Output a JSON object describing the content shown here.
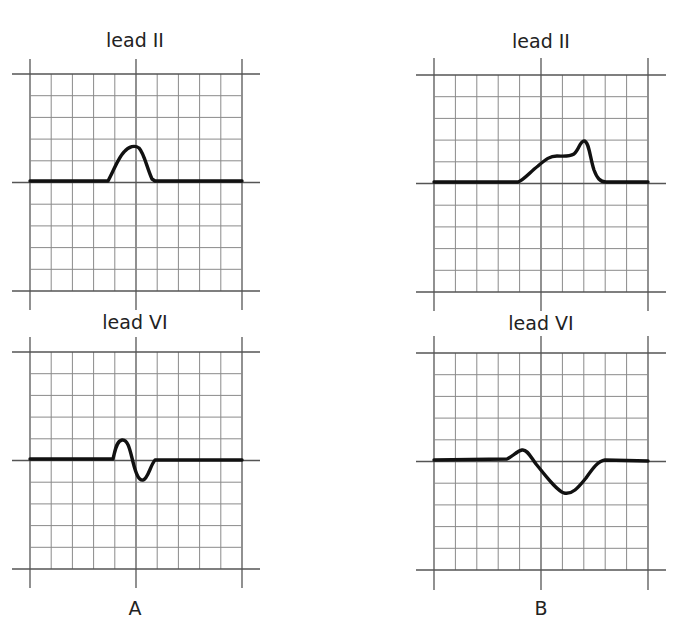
{
  "figure": {
    "columns": [
      {
        "id": "A",
        "caption": "A",
        "panels": [
          {
            "lead": "lead II",
            "description": "normal P wave: single smooth positive hump"
          },
          {
            "lead": "lead VI",
            "description": "biphasic P wave: small positive then small negative deflection"
          }
        ]
      },
      {
        "id": "B",
        "caption": "B",
        "panels": [
          {
            "lead": "lead II",
            "description": "broad notched (bifid) P wave, second peak taller"
          },
          {
            "lead": "lead VI",
            "description": "biphasic P wave with small positive then broad deep negative terminal component"
          }
        ]
      }
    ],
    "grid": {
      "columns": 10,
      "rows": 10,
      "cell_px": 21.3,
      "major_every": 5
    },
    "colors": {
      "grid_minor": "#8a8a8a",
      "grid_major": "#555555",
      "trace": "#111111",
      "text": "#222222",
      "background": "#ffffff"
    }
  }
}
